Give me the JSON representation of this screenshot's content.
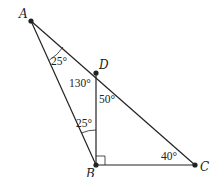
{
  "diagram": {
    "type": "geometry-triangle",
    "points": {
      "A": {
        "label": "A",
        "x": 31,
        "y": 21
      },
      "D": {
        "label": "D",
        "x": 96,
        "y": 73
      },
      "B": {
        "label": "B",
        "x": 96,
        "y": 165
      },
      "C": {
        "label": "C",
        "x": 195,
        "y": 165
      }
    },
    "segments": [
      "AB",
      "AC",
      "DB",
      "BC"
    ],
    "angles": {
      "angle_A": "25°",
      "angle_ADB": "130°",
      "angle_BDC": "50°",
      "angle_ABD": "25°",
      "angle_C": "40°"
    },
    "right_angle_at": "B",
    "colors": {
      "line": "#222222",
      "background": "#ffffff"
    }
  }
}
